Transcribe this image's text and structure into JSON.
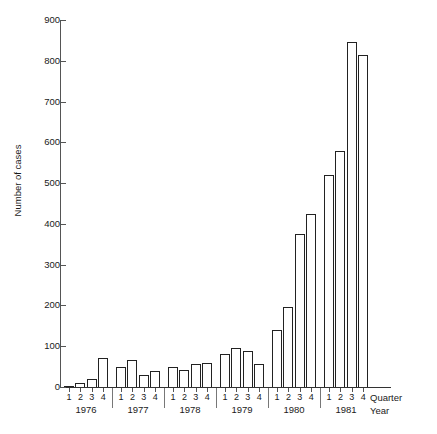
{
  "chart_data": {
    "type": "bar",
    "title": "",
    "subtitle": "",
    "xlabel": "Quarter / Year",
    "ylabel": "Number of cases",
    "ylim": [
      0,
      900
    ],
    "ytick_step": 100,
    "grid": false,
    "legend": null,
    "axis_names": {
      "quarter": "Quarter",
      "year": "Year"
    },
    "ytick_labels": [
      "0",
      "100",
      "200",
      "300",
      "400",
      "500",
      "600",
      "700",
      "800",
      "900"
    ],
    "ytick_values": [
      0,
      100,
      200,
      300,
      400,
      500,
      600,
      700,
      800,
      900
    ],
    "years": [
      "1976",
      "1977",
      "1978",
      "1979",
      "1980",
      "1981"
    ],
    "quarters": [
      "1",
      "2",
      "3",
      "4"
    ],
    "categories": [
      "1976 Q1",
      "1976 Q2",
      "1976 Q3",
      "1976 Q4",
      "1977 Q1",
      "1977 Q2",
      "1977 Q3",
      "1977 Q4",
      "1978 Q1",
      "1978 Q2",
      "1978 Q3",
      "1978 Q4",
      "1979 Q1",
      "1979 Q2",
      "1979 Q3",
      "1979 Q4",
      "1980 Q1",
      "1980 Q2",
      "1980 Q3",
      "1980 Q4",
      "1981 Q1",
      "1981 Q2",
      "1981 Q3",
      "1981 Q4"
    ],
    "values": [
      3,
      10,
      19,
      70,
      48,
      67,
      29,
      40,
      50,
      42,
      57,
      59,
      80,
      95,
      88,
      57,
      140,
      195,
      375,
      425,
      520,
      580,
      845,
      815
    ]
  }
}
